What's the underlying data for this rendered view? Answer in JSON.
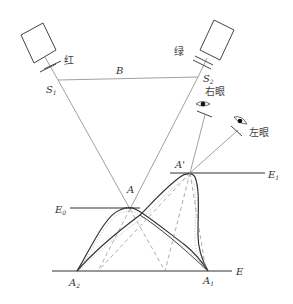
{
  "figure": {
    "type": "stereoscopic-projection-diagram",
    "projectors": [
      {
        "id": "left",
        "color_label": "红",
        "slit_label": "S",
        "slit_subscript": "1"
      },
      {
        "id": "right",
        "color_label": "绿",
        "slit_label": "S",
        "slit_subscript": "2"
      }
    ],
    "baseline_label": "B",
    "eyes": {
      "right": "右眼",
      "left": "左眼"
    },
    "points": {
      "A": {
        "label": "A"
      },
      "A_prime": {
        "label": "A'"
      },
      "A1": {
        "label": "A",
        "subscript": "1"
      },
      "A2": {
        "label": "A",
        "subscript": "2"
      }
    },
    "planes": {
      "E0": {
        "label": "E",
        "subscript": "0"
      },
      "E1": {
        "label": "E",
        "subscript": "1"
      },
      "E": {
        "label": "E"
      }
    }
  }
}
